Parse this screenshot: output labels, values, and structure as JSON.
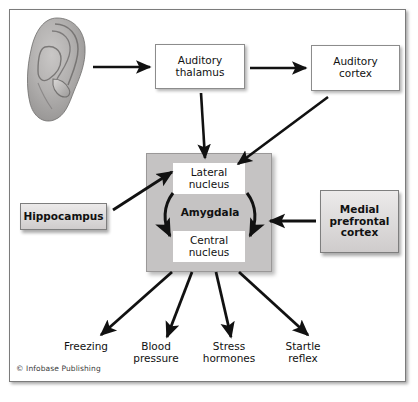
{
  "figure": {
    "copyright": "© Infobase Publishing",
    "background_color": "#ffffff",
    "frame_color": "#7b7b7b",
    "amygdala_fill": "#c5c3c3",
    "arrow_color": "#111111"
  },
  "nodes": {
    "ear": {
      "name": "ear",
      "label": ""
    },
    "auditory_thalamus": {
      "line1": "Auditory",
      "line2": "thalamus",
      "fill": "#ffffff"
    },
    "auditory_cortex": {
      "line1": "Auditory",
      "line2": "cortex",
      "fill": "#ffffff"
    },
    "hippocampus": {
      "label": "Hippocampus",
      "fill": "#dcdada"
    },
    "medial_prefrontal_cortex": {
      "line1": "Medial",
      "line2": "prefrontal",
      "line3": "cortex",
      "fill": "#dcdada"
    },
    "amygdala": {
      "label": "Amygdala",
      "fill": "#c5c3c3"
    },
    "lateral_nucleus": {
      "line1": "Lateral",
      "line2": "nucleus",
      "fill": "#ffffff"
    },
    "central_nucleus": {
      "line1": "Central",
      "line2": "nucleus",
      "fill": "#ffffff"
    }
  },
  "outputs": [
    {
      "line1": "Freezing",
      "line2": ""
    },
    {
      "line1": "Blood",
      "line2": "pressure"
    },
    {
      "line1": "Stress",
      "line2": "hormones"
    },
    {
      "line1": "Startle",
      "line2": "reflex"
    }
  ],
  "edges": [
    {
      "from": "ear",
      "to": "auditory_thalamus",
      "style": "straight-arrow"
    },
    {
      "from": "auditory_thalamus",
      "to": "auditory_cortex",
      "style": "straight-arrow"
    },
    {
      "from": "auditory_thalamus",
      "to": "lateral_nucleus",
      "style": "straight-arrow"
    },
    {
      "from": "auditory_cortex",
      "to": "lateral_nucleus",
      "style": "straight-arrow"
    },
    {
      "from": "hippocampus",
      "to": "lateral_nucleus",
      "style": "straight-arrow"
    },
    {
      "from": "medial_prefrontal_cortex",
      "to": "amygdala",
      "style": "straight-arrow"
    },
    {
      "from": "lateral_nucleus",
      "to": "central_nucleus",
      "style": "curved-arrow-left"
    },
    {
      "from": "lateral_nucleus",
      "to": "central_nucleus",
      "style": "curved-arrow-right"
    },
    {
      "from": "central_nucleus",
      "to": "Freezing",
      "style": "straight-arrow"
    },
    {
      "from": "central_nucleus",
      "to": "Blood pressure",
      "style": "straight-arrow"
    },
    {
      "from": "central_nucleus",
      "to": "Stress hormones",
      "style": "straight-arrow"
    },
    {
      "from": "central_nucleus",
      "to": "Startle reflex",
      "style": "straight-arrow"
    }
  ]
}
